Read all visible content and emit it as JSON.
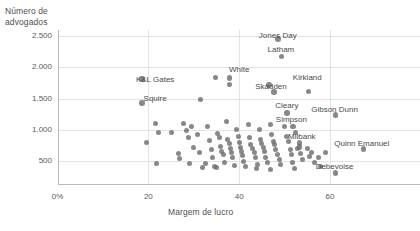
{
  "chart_data": {
    "type": "scatter",
    "title": "",
    "xlabel": "Margem de lucro",
    "ylabel": "Número de\nadvogados",
    "xlim": [
      0,
      68
    ],
    "ylim": [
      0,
      2750
    ],
    "grid": true,
    "legend": "none",
    "xticks": [
      {
        "value": 0,
        "label": "0%"
      },
      {
        "value": 20,
        "label": "20"
      },
      {
        "value": 40,
        "label": "40"
      },
      {
        "value": 60,
        "label": "60"
      }
    ],
    "yticks": [
      {
        "value": 2500,
        "label": "2.500"
      },
      {
        "value": 2000,
        "label": "2.000"
      },
      {
        "value": 1500,
        "label": "1.500"
      },
      {
        "value": 1000,
        "label": "1.000"
      },
      {
        "value": 500,
        "label": "500"
      }
    ],
    "point_color": "#6e6e6e",
    "grid_color": "#e3e3e3",
    "axis_color": "#b9b9b9",
    "annotations": [
      {
        "text": "Jones Day",
        "x": 48.5,
        "y": 2500
      },
      {
        "text": "Latham",
        "x": 49.2,
        "y": 2270
      },
      {
        "text": "White",
        "x": 40.0,
        "y": 1960
      },
      {
        "text": "Kirkland",
        "x": 55.0,
        "y": 1830
      },
      {
        "text": "Skadden",
        "x": 47.0,
        "y": 1680
      },
      {
        "text": "K&L Gates",
        "x": 21.5,
        "y": 1790
      },
      {
        "text": "Squire",
        "x": 21.5,
        "y": 1500
      },
      {
        "text": "Cleary",
        "x": 50.5,
        "y": 1380
      },
      {
        "text": "Gibson Dunn",
        "x": 61.0,
        "y": 1310
      },
      {
        "text": "Simpson",
        "x": 51.5,
        "y": 1150
      },
      {
        "text": "Milbank",
        "x": 53.8,
        "y": 890
      },
      {
        "text": "Quinn Emanuel",
        "x": 67.0,
        "y": 780
      },
      {
        "text": "Debevoise",
        "x": 61.0,
        "y": 400
      }
    ],
    "points": [
      {
        "x": 18.5,
        "y": 1820,
        "label": "K&L Gates"
      },
      {
        "x": 18.5,
        "y": 1430,
        "label": "Squire"
      },
      {
        "x": 48.5,
        "y": 2460,
        "label": "Jones Day"
      },
      {
        "x": 49.3,
        "y": 2180,
        "label": "Latham"
      },
      {
        "x": 46.5,
        "y": 1720,
        "label": "Skadden"
      },
      {
        "x": 47.6,
        "y": 1610,
        "label": "Skadden-2"
      },
      {
        "x": 55.2,
        "y": 1620,
        "label": "Kirkland"
      },
      {
        "x": 37.8,
        "y": 1830,
        "label": "White"
      },
      {
        "x": 37.8,
        "y": 1730,
        "label": "White-2"
      },
      {
        "x": 34.8,
        "y": 1830,
        "label": ""
      },
      {
        "x": 31.5,
        "y": 1490,
        "label": ""
      },
      {
        "x": 50.5,
        "y": 1270,
        "label": "Cleary"
      },
      {
        "x": 61.2,
        "y": 1240,
        "label": "Gibson Dunn"
      },
      {
        "x": 51.8,
        "y": 1060,
        "label": "Simpson"
      },
      {
        "x": 53.2,
        "y": 790,
        "label": "Milbank"
      },
      {
        "x": 53.2,
        "y": 730,
        "label": "Milbank-2"
      },
      {
        "x": 67.3,
        "y": 700,
        "label": "Quinn Emanuel"
      },
      {
        "x": 61.2,
        "y": 315,
        "label": "Debevoise"
      },
      {
        "x": 21.5,
        "y": 1100,
        "label": ""
      },
      {
        "x": 22.2,
        "y": 960,
        "label": ""
      },
      {
        "x": 19.5,
        "y": 800,
        "label": ""
      },
      {
        "x": 21.8,
        "y": 455,
        "label": ""
      },
      {
        "x": 25.0,
        "y": 960,
        "label": ""
      },
      {
        "x": 26.6,
        "y": 620,
        "label": ""
      },
      {
        "x": 26.8,
        "y": 540,
        "label": ""
      },
      {
        "x": 28.5,
        "y": 990,
        "label": ""
      },
      {
        "x": 28.8,
        "y": 880,
        "label": ""
      },
      {
        "x": 29.5,
        "y": 1060,
        "label": ""
      },
      {
        "x": 30.0,
        "y": 720,
        "label": ""
      },
      {
        "x": 30.8,
        "y": 920,
        "label": ""
      },
      {
        "x": 31.2,
        "y": 640,
        "label": ""
      },
      {
        "x": 32.0,
        "y": 400,
        "label": ""
      },
      {
        "x": 33.0,
        "y": 1050,
        "label": ""
      },
      {
        "x": 33.5,
        "y": 830,
        "label": ""
      },
      {
        "x": 33.8,
        "y": 690,
        "label": ""
      },
      {
        "x": 34.2,
        "y": 560,
        "label": ""
      },
      {
        "x": 34.5,
        "y": 420,
        "label": ""
      },
      {
        "x": 35.2,
        "y": 940,
        "label": ""
      },
      {
        "x": 35.6,
        "y": 880,
        "label": ""
      },
      {
        "x": 35.8,
        "y": 740,
        "label": ""
      },
      {
        "x": 36.2,
        "y": 660,
        "label": ""
      },
      {
        "x": 36.5,
        "y": 600,
        "label": ""
      },
      {
        "x": 36.8,
        "y": 480,
        "label": ""
      },
      {
        "x": 37.2,
        "y": 1140,
        "label": ""
      },
      {
        "x": 37.5,
        "y": 840,
        "label": ""
      },
      {
        "x": 37.8,
        "y": 780,
        "label": ""
      },
      {
        "x": 38.0,
        "y": 700,
        "label": ""
      },
      {
        "x": 38.3,
        "y": 630,
        "label": ""
      },
      {
        "x": 38.6,
        "y": 560,
        "label": ""
      },
      {
        "x": 39.0,
        "y": 430,
        "label": ""
      },
      {
        "x": 39.5,
        "y": 1010,
        "label": ""
      },
      {
        "x": 39.8,
        "y": 900,
        "label": ""
      },
      {
        "x": 40.0,
        "y": 790,
        "label": ""
      },
      {
        "x": 40.2,
        "y": 720,
        "label": ""
      },
      {
        "x": 40.5,
        "y": 650,
        "label": ""
      },
      {
        "x": 40.8,
        "y": 590,
        "label": ""
      },
      {
        "x": 41.0,
        "y": 500,
        "label": ""
      },
      {
        "x": 41.4,
        "y": 420,
        "label": ""
      },
      {
        "x": 42.0,
        "y": 1080,
        "label": ""
      },
      {
        "x": 42.3,
        "y": 880,
        "label": ""
      },
      {
        "x": 42.6,
        "y": 770,
        "label": ""
      },
      {
        "x": 43.0,
        "y": 700,
        "label": ""
      },
      {
        "x": 43.3,
        "y": 640,
        "label": ""
      },
      {
        "x": 43.6,
        "y": 560,
        "label": ""
      },
      {
        "x": 44.0,
        "y": 450,
        "label": ""
      },
      {
        "x": 44.5,
        "y": 1000,
        "label": ""
      },
      {
        "x": 44.8,
        "y": 850,
        "label": ""
      },
      {
        "x": 45.0,
        "y": 780,
        "label": ""
      },
      {
        "x": 45.3,
        "y": 720,
        "label": ""
      },
      {
        "x": 45.6,
        "y": 660,
        "label": ""
      },
      {
        "x": 45.9,
        "y": 560,
        "label": ""
      },
      {
        "x": 46.2,
        "y": 470,
        "label": ""
      },
      {
        "x": 46.8,
        "y": 1080,
        "label": ""
      },
      {
        "x": 47.2,
        "y": 920,
        "label": ""
      },
      {
        "x": 47.5,
        "y": 820,
        "label": ""
      },
      {
        "x": 47.8,
        "y": 760,
        "label": ""
      },
      {
        "x": 48.0,
        "y": 680,
        "label": ""
      },
      {
        "x": 48.4,
        "y": 600,
        "label": ""
      },
      {
        "x": 48.8,
        "y": 520,
        "label": ""
      },
      {
        "x": 49.2,
        "y": 440,
        "label": ""
      },
      {
        "x": 50.0,
        "y": 1060,
        "label": ""
      },
      {
        "x": 50.4,
        "y": 900,
        "label": ""
      },
      {
        "x": 50.8,
        "y": 810,
        "label": ""
      },
      {
        "x": 51.2,
        "y": 690,
        "label": ""
      },
      {
        "x": 51.5,
        "y": 600,
        "label": ""
      },
      {
        "x": 51.8,
        "y": 480,
        "label": ""
      },
      {
        "x": 52.5,
        "y": 960,
        "label": ""
      },
      {
        "x": 52.8,
        "y": 700,
        "label": ""
      },
      {
        "x": 53.5,
        "y": 620,
        "label": ""
      },
      {
        "x": 54.0,
        "y": 520,
        "label": ""
      },
      {
        "x": 55.0,
        "y": 700,
        "label": ""
      },
      {
        "x": 55.5,
        "y": 580,
        "label": ""
      },
      {
        "x": 56.0,
        "y": 640,
        "label": ""
      },
      {
        "x": 56.5,
        "y": 470,
        "label": ""
      },
      {
        "x": 57.5,
        "y": 560,
        "label": ""
      },
      {
        "x": 58.0,
        "y": 420,
        "label": ""
      },
      {
        "x": 59.0,
        "y": 640,
        "label": ""
      },
      {
        "x": 27.8,
        "y": 1100,
        "label": ""
      },
      {
        "x": 29.0,
        "y": 460,
        "label": ""
      },
      {
        "x": 32.6,
        "y": 460,
        "label": ""
      },
      {
        "x": 35.0,
        "y": 400,
        "label": ""
      },
      {
        "x": 43.8,
        "y": 380,
        "label": ""
      },
      {
        "x": 47.0,
        "y": 360,
        "label": ""
      },
      {
        "x": 52.2,
        "y": 380,
        "label": ""
      }
    ]
  }
}
